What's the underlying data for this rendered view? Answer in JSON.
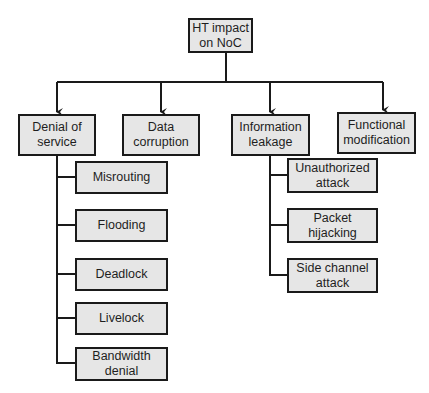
{
  "colors": {
    "box_fill": "#e6e6e6",
    "stroke": "#1a1a1a",
    "text": "#1e1e1e"
  },
  "root": {
    "label": "HT impact\non NoC"
  },
  "categories": [
    {
      "label": "Denial of\nservice"
    },
    {
      "label": "Data\ncorruption"
    },
    {
      "label": "Information\nleakage"
    },
    {
      "label": "Functional\nmodification"
    }
  ],
  "denial_of_service_children": [
    {
      "label": "Misrouting"
    },
    {
      "label": "Flooding"
    },
    {
      "label": "Deadlock"
    },
    {
      "label": "Livelock"
    },
    {
      "label": "Bandwidth\ndenial"
    }
  ],
  "information_leakage_children": [
    {
      "label": "Unauthorized\nattack"
    },
    {
      "label": "Packet\nhijacking"
    },
    {
      "label": "Side channel\nattack"
    }
  ]
}
